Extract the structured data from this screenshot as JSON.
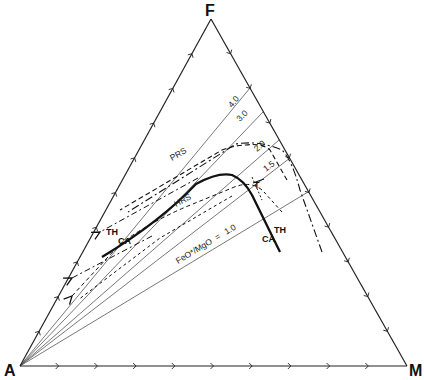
{
  "diagram": {
    "type": "AFM ternary diagram",
    "vertices": {
      "apex_top": "F",
      "bottom_left": "A",
      "bottom_right": "M"
    },
    "ratio_lines": {
      "axis_label": "FeO*/MgO",
      "equals_sign": "=",
      "values": [
        "1.0",
        "1.5",
        "2.0",
        "3.0",
        "4.0"
      ]
    },
    "trend_labels": {
      "prs": "PRS",
      "hrs": "HRS",
      "th_left": "TH",
      "ca_left": "CA",
      "th_right": "TH",
      "ca_right": "CA",
      "t_marker": "T"
    },
    "colors": {
      "line": "#111111",
      "thin_line": "#444444",
      "background": "#ffffff"
    }
  },
  "chart_data": {
    "type": "ternary",
    "title": "",
    "vertices": [
      "F",
      "A",
      "M"
    ],
    "edge_ticks_per_side": 9,
    "tick_interval_percent": 10,
    "ratio_lines": [
      {
        "label": "1.0",
        "ratio": 1.0
      },
      {
        "label": "1.5",
        "ratio": 1.5
      },
      {
        "label": "2.0",
        "ratio": 2.0
      },
      {
        "label": "3.0",
        "ratio": 3.0
      },
      {
        "label": "4.0",
        "ratio": 4.0
      }
    ],
    "series": [
      {
        "name": "TH-CA boundary (solid)",
        "style": "solid-bold"
      },
      {
        "name": "PRS",
        "style": "dash-dot"
      },
      {
        "name": "HRS",
        "style": "dashed"
      }
    ],
    "annotations": [
      "TH",
      "CA",
      "TH",
      "CA",
      "PRS",
      "HRS",
      "T",
      "FeO*/MgO = 1.0"
    ]
  }
}
